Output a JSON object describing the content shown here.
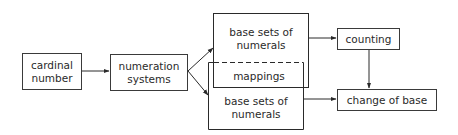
{
  "diagram": {
    "nodes": {
      "cardinal_number": {
        "line1": "cardinal",
        "line2": "number"
      },
      "numeration_systems": {
        "line1": "numeration",
        "line2": "systems"
      },
      "base_sets_top": {
        "line1": "base sets of",
        "line2": "numerals"
      },
      "mappings": {
        "label": "mappings"
      },
      "base_sets_bottom": {
        "line1": "base sets of",
        "line2": "numerals"
      },
      "counting": {
        "label": "counting"
      },
      "change_of_base": {
        "label": "change of base"
      }
    },
    "edges": [
      {
        "from": "cardinal number",
        "to": "numeration systems"
      },
      {
        "from": "numeration systems",
        "to": "base sets of numerals (top)"
      },
      {
        "from": "numeration systems",
        "to": "base sets of numerals (bottom)"
      },
      {
        "from": "base sets of numerals (top)",
        "to": "counting"
      },
      {
        "from": "base sets of numerals (bottom)",
        "to": "change of base"
      },
      {
        "from": "counting",
        "to": "change of base"
      }
    ]
  }
}
